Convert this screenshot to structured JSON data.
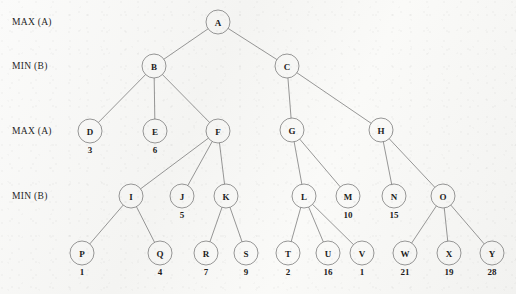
{
  "diagram": {
    "colors": {
      "background": "#f6f6f4",
      "stroke": "#6b6b6b",
      "text": "#1c1c1c"
    },
    "level_labels": [
      {
        "text": "MAX (A)",
        "x": 12,
        "y": 22
      },
      {
        "text": "MIN (B)",
        "x": 12,
        "y": 66
      },
      {
        "text": "MAX (A)",
        "x": 12,
        "y": 131
      },
      {
        "text": "MIN (B)",
        "x": 12,
        "y": 196
      }
    ],
    "node_radius": 12,
    "nodes": [
      {
        "id": "A",
        "label": "A",
        "x": 218,
        "y": 22,
        "level": 0,
        "value": null
      },
      {
        "id": "B",
        "label": "B",
        "x": 154,
        "y": 66,
        "level": 1,
        "value": null
      },
      {
        "id": "C",
        "label": "C",
        "x": 287,
        "y": 66,
        "level": 1,
        "value": null
      },
      {
        "id": "D",
        "label": "D",
        "x": 90,
        "y": 131,
        "level": 2,
        "value": "3"
      },
      {
        "id": "E",
        "label": "E",
        "x": 155,
        "y": 131,
        "level": 2,
        "value": "6"
      },
      {
        "id": "F",
        "label": "F",
        "x": 218,
        "y": 131,
        "level": 2,
        "value": null
      },
      {
        "id": "G",
        "label": "G",
        "x": 292,
        "y": 130,
        "level": 2,
        "value": null
      },
      {
        "id": "H",
        "label": "H",
        "x": 381,
        "y": 130,
        "level": 2,
        "value": null
      },
      {
        "id": "I",
        "label": "I",
        "x": 131,
        "y": 196,
        "level": 3,
        "value": null
      },
      {
        "id": "J",
        "label": "J",
        "x": 182,
        "y": 196,
        "level": 3,
        "value": "5"
      },
      {
        "id": "K",
        "label": "K",
        "x": 226,
        "y": 196,
        "level": 3,
        "value": null
      },
      {
        "id": "L",
        "label": "L",
        "x": 304,
        "y": 196,
        "level": 3,
        "value": null
      },
      {
        "id": "M",
        "label": "M",
        "x": 348,
        "y": 196,
        "level": 3,
        "value": "10"
      },
      {
        "id": "N",
        "label": "N",
        "x": 394,
        "y": 196,
        "level": 3,
        "value": "15"
      },
      {
        "id": "O",
        "label": "O",
        "x": 443,
        "y": 196,
        "level": 3,
        "value": null
      },
      {
        "id": "P",
        "label": "P",
        "x": 82,
        "y": 253,
        "level": 4,
        "value": "1"
      },
      {
        "id": "Q",
        "label": "Q",
        "x": 160,
        "y": 253,
        "level": 4,
        "value": "4"
      },
      {
        "id": "R",
        "label": "R",
        "x": 206,
        "y": 253,
        "level": 4,
        "value": "7"
      },
      {
        "id": "S",
        "label": "S",
        "x": 246,
        "y": 253,
        "level": 4,
        "value": "9"
      },
      {
        "id": "T",
        "label": "T",
        "x": 288,
        "y": 253,
        "level": 4,
        "value": "2"
      },
      {
        "id": "U",
        "label": "U",
        "x": 328,
        "y": 253,
        "level": 4,
        "value": "16"
      },
      {
        "id": "V",
        "label": "V",
        "x": 362,
        "y": 253,
        "level": 4,
        "value": "1"
      },
      {
        "id": "W",
        "label": "W",
        "x": 405,
        "y": 253,
        "level": 4,
        "value": "21"
      },
      {
        "id": "X",
        "label": "X",
        "x": 449,
        "y": 253,
        "level": 4,
        "value": "19"
      },
      {
        "id": "Y",
        "label": "Y",
        "x": 492,
        "y": 253,
        "level": 4,
        "value": "28"
      }
    ],
    "edges": [
      {
        "from": "A",
        "to": "B"
      },
      {
        "from": "A",
        "to": "C"
      },
      {
        "from": "B",
        "to": "D"
      },
      {
        "from": "B",
        "to": "E"
      },
      {
        "from": "B",
        "to": "F"
      },
      {
        "from": "C",
        "to": "G"
      },
      {
        "from": "C",
        "to": "H"
      },
      {
        "from": "F",
        "to": "I"
      },
      {
        "from": "F",
        "to": "J"
      },
      {
        "from": "F",
        "to": "K"
      },
      {
        "from": "G",
        "to": "L"
      },
      {
        "from": "G",
        "to": "M"
      },
      {
        "from": "H",
        "to": "N"
      },
      {
        "from": "H",
        "to": "O"
      },
      {
        "from": "I",
        "to": "P"
      },
      {
        "from": "I",
        "to": "Q"
      },
      {
        "from": "K",
        "to": "R"
      },
      {
        "from": "K",
        "to": "S"
      },
      {
        "from": "L",
        "to": "T"
      },
      {
        "from": "L",
        "to": "U"
      },
      {
        "from": "L",
        "to": "V"
      },
      {
        "from": "O",
        "to": "W"
      },
      {
        "from": "O",
        "to": "X"
      },
      {
        "from": "O",
        "to": "Y"
      }
    ],
    "value_offset_y": 19
  }
}
